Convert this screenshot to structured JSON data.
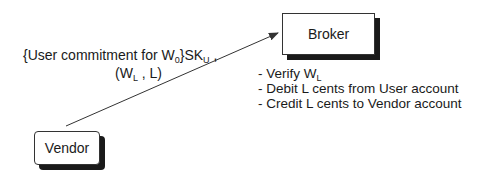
{
  "nodes": {
    "broker": {
      "label": "Broker"
    },
    "vendor": {
      "label": "Vendor"
    }
  },
  "edge": {
    "from": "vendor",
    "to": "broker",
    "label_line1": {
      "pre": "{User commitment for W",
      "sub1": "0",
      "mid": "}SK",
      "sub2": "U",
      "post": " ,"
    },
    "label_line2": {
      "pre": "(W",
      "sub": "L",
      "post": " , L)"
    }
  },
  "broker_actions": [
    {
      "pre": "- Verify W",
      "sub": "L",
      "post": ""
    },
    {
      "pre": "- Debit L cents from User account",
      "sub": "",
      "post": ""
    },
    {
      "pre": "- Credit L cents to Vendor account",
      "sub": "",
      "post": ""
    }
  ]
}
